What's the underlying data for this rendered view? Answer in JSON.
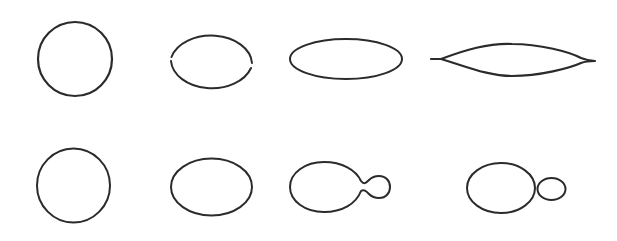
{
  "diagram": {
    "stroke_color": "#2b2b2b",
    "background": "#ffffff",
    "rows": [
      {
        "name": "elongation-sequence",
        "shapes": [
          {
            "kind": "circle",
            "label": "circle"
          },
          {
            "kind": "ellipse",
            "label": "ellipse (with small breaks on left and right)"
          },
          {
            "kind": "ellipse",
            "label": "elongated ellipse"
          },
          {
            "kind": "lens",
            "label": "lens / spindle with pointed tips"
          }
        ]
      },
      {
        "name": "budding-sequence",
        "shapes": [
          {
            "kind": "circle",
            "label": "circle"
          },
          {
            "kind": "ellipse",
            "label": "ellipse"
          },
          {
            "kind": "budding",
            "label": "ellipse with attached bud (necked)"
          },
          {
            "kind": "separated",
            "label": "ellipse and separated small circle"
          }
        ]
      }
    ]
  }
}
